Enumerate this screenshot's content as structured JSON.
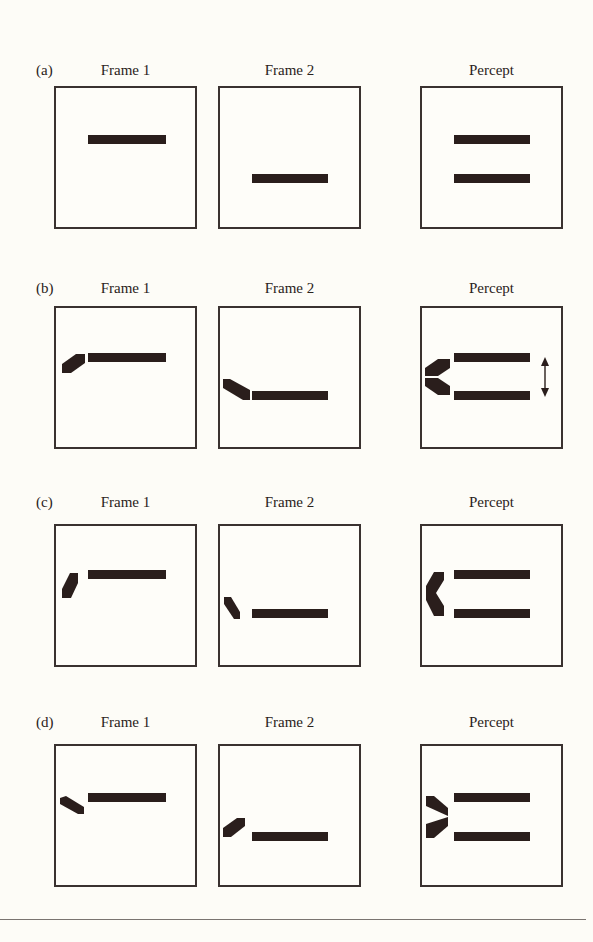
{
  "figure": {
    "columns": [
      "Frame 1",
      "Frame 2",
      "Percept"
    ],
    "rows": [
      {
        "label": "(a)",
        "description": "Two horizontal bars presented in successive frames; perceived as two static bars",
        "flanker": "none",
        "arrow": false
      },
      {
        "label": "(b)",
        "description": "Bars with oblique flankers angled toward each other; percept shows vertical motion",
        "flanker": "oblique-converging",
        "arrow": true
      },
      {
        "label": "(c)",
        "description": "Bars with steep flankers; percept shows bracket-like connection",
        "flanker": "steep-converging",
        "arrow": false
      },
      {
        "label": "(d)",
        "description": "Bars with flankers angled away; percept shows arrowhead pointing right",
        "flanker": "oblique-diverging",
        "arrow": false
      }
    ],
    "colors": {
      "ink": "#2a1e1c",
      "background": "#fdfcf7",
      "frame_border": "#3a3230"
    }
  }
}
